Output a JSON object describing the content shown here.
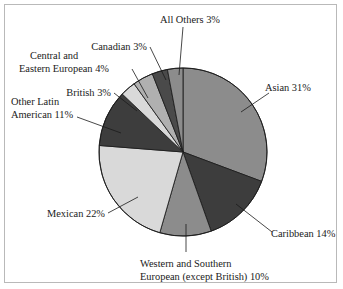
{
  "figure": {
    "frame_visible": true,
    "frame_color": "#b9b9b9",
    "background": "#ffffff",
    "text_color": "#1b1b1b"
  },
  "chart_data": {
    "type": "pie",
    "title": "",
    "subtitle": "",
    "xlabel": "",
    "ylabel": "",
    "legend_position": "callout-labels",
    "grid": false,
    "start_angle_deg": 0,
    "direction": "clockwise",
    "center": {
      "x": 183,
      "y": 152
    },
    "radius": 84,
    "total_percent": 101,
    "categories": [
      "Asian",
      "Caribbean",
      "Western and Southern European (except British)",
      "Mexican",
      "Other Latin American",
      "British",
      "Central and Eastern European",
      "Canadian",
      "All Others"
    ],
    "values": [
      31,
      14,
      10,
      22,
      11,
      3,
      4,
      3,
      3
    ],
    "colors": [
      "#8c8c8c",
      "#3d3d3d",
      "#8c8c8c",
      "#d9d9d9",
      "#3d3d3d",
      "#d9d9d9",
      "#b0b0b0",
      "#4a4a4a",
      "#8c8c8c"
    ],
    "slices": [
      {
        "name": "Asian",
        "value": 31,
        "label": "Asian 31%",
        "color": "#8c8c8c",
        "start_deg": 0,
        "end_deg": 110.5
      },
      {
        "name": "Caribbean",
        "value": 14,
        "label": "Caribbean 14%",
        "color": "#3d3d3d",
        "start_deg": 110.5,
        "end_deg": 160.4
      },
      {
        "name": "Western and Southern European (except British)",
        "value": 10,
        "label": "Western and Southern European (except British) 10%",
        "label_line_1": "Western and Southern",
        "label_line_2": "European (except British) 10%",
        "color": "#8c8c8c",
        "start_deg": 160.4,
        "end_deg": 196.0
      },
      {
        "name": "Mexican",
        "value": 22,
        "label": "Mexican 22%",
        "color": "#d9d9d9",
        "start_deg": 196.0,
        "end_deg": 274.5
      },
      {
        "name": "Other Latin American",
        "value": 11,
        "label": "Other Latin American 11%",
        "label_line_1": "Other Latin",
        "label_line_2": "American 11%",
        "color": "#3d3d3d",
        "start_deg": 274.5,
        "end_deg": 313.7
      },
      {
        "name": "British",
        "value": 3,
        "label": "British 3%",
        "color": "#d9d9d9",
        "start_deg": 313.7,
        "end_deg": 324.4
      },
      {
        "name": "Central and Eastern European",
        "value": 4,
        "label": "Central and Eastern European 4%",
        "label_line_1": "Central and",
        "label_line_2": "Eastern European 4%",
        "color": "#b0b0b0",
        "start_deg": 324.4,
        "end_deg": 338.6
      },
      {
        "name": "Canadian",
        "value": 3,
        "label": "Canadian 3%",
        "color": "#4a4a4a",
        "start_deg": 338.6,
        "end_deg": 349.3
      },
      {
        "name": "All Others",
        "value": 3,
        "label": "All Others 3%",
        "color": "#8c8c8c",
        "start_deg": 349.3,
        "end_deg": 360.0
      }
    ]
  },
  "labels": {
    "asian": "Asian 31%",
    "caribbean": "Caribbean 14%",
    "western_southern_european_line1": "Western and Southern",
    "western_southern_european_line2": "European (except British) 10%",
    "mexican": "Mexican 22%",
    "other_latin_american_line1": "Other Latin",
    "other_latin_american_line2": "American 11%",
    "british": "British 3%",
    "central_eastern_european_line1": "Central and",
    "central_eastern_european_line2": "Eastern European 4%",
    "canadian": "Canadian 3%",
    "all_others": "All Others 3%"
  }
}
